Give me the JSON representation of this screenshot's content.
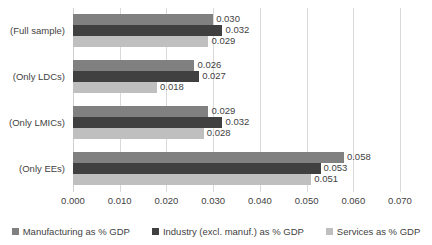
{
  "chart_data": {
    "type": "bar",
    "orientation": "horizontal",
    "title": "",
    "xlabel": "",
    "ylabel": "",
    "xlim": [
      0.0,
      0.07
    ],
    "xticks": [
      "0.000",
      "0.010",
      "0.020",
      "0.030",
      "0.040",
      "0.050",
      "0.060",
      "0.070"
    ],
    "xtick_values": [
      0.0,
      0.01,
      0.02,
      0.03,
      0.04,
      0.05,
      0.06,
      0.07
    ],
    "grid": "vertical",
    "legend_position": "bottom",
    "categories": [
      "(Full sample)",
      "(Only LDCs)",
      "(Only LMICs)",
      "(Only EEs)"
    ],
    "series": [
      {
        "name": "Manufacturing as % GDP",
        "color": "#808080",
        "values": [
          0.03,
          0.026,
          0.029,
          0.058
        ],
        "labels": [
          "0.030",
          "0.026",
          "0.029",
          "0.058"
        ]
      },
      {
        "name": "Industry (excl. manuf.) as % GDP",
        "color": "#404040",
        "values": [
          0.032,
          0.027,
          0.032,
          0.053
        ],
        "labels": [
          "0.032",
          "0.027",
          "0.032",
          "0.053"
        ]
      },
      {
        "name": "Services as % GDP",
        "color": "#bfbfbf",
        "values": [
          0.029,
          0.018,
          0.028,
          0.051
        ],
        "labels": [
          "0.029",
          "0.018",
          "0.028",
          "0.051"
        ]
      }
    ]
  }
}
